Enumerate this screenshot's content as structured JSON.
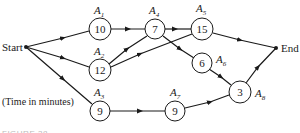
{
  "diagram": {
    "type": "activity-network",
    "start_label": "Start",
    "end_label": "End",
    "caption": "(Time in minutes)",
    "figure_label": "FIGURE 38",
    "nodes": [
      {
        "id": "A1",
        "activity": "A",
        "sub": "1",
        "time": "10"
      },
      {
        "id": "A2",
        "activity": "A",
        "sub": "2",
        "time": "12"
      },
      {
        "id": "A3",
        "activity": "A",
        "sub": "3",
        "time": "9"
      },
      {
        "id": "A4",
        "activity": "A",
        "sub": "4",
        "time": "7"
      },
      {
        "id": "A5",
        "activity": "A",
        "sub": "5",
        "time": "15"
      },
      {
        "id": "A6",
        "activity": "A",
        "sub": "6",
        "time": "6"
      },
      {
        "id": "A7",
        "activity": "A",
        "sub": "7",
        "time": "9"
      },
      {
        "id": "A8",
        "activity": "A",
        "sub": "8",
        "time": "3"
      }
    ],
    "edges": [
      {
        "from": "Start",
        "to": "A1"
      },
      {
        "from": "Start",
        "to": "A2"
      },
      {
        "from": "Start",
        "to": "A3"
      },
      {
        "from": "A1",
        "to": "A4"
      },
      {
        "from": "A2",
        "to": "A4"
      },
      {
        "from": "A2",
        "to": "A5"
      },
      {
        "from": "A4",
        "to": "A5"
      },
      {
        "from": "A4",
        "to": "A6"
      },
      {
        "from": "A5",
        "to": "End"
      },
      {
        "from": "A6",
        "to": "A8"
      },
      {
        "from": "A3",
        "to": "A7"
      },
      {
        "from": "A7",
        "to": "A8"
      },
      {
        "from": "A8",
        "to": "End"
      }
    ]
  }
}
